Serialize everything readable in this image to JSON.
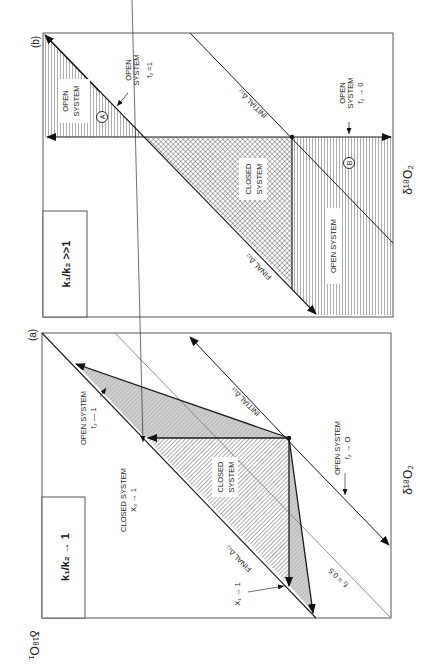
{
  "figure": {
    "orientation": "rotated-90-ccw",
    "colors": {
      "line": "#1a1a1a",
      "thin_line": "#6a6a6a",
      "shade": "#cfcfcf",
      "frame": "#555555"
    }
  },
  "panel_b": {
    "tag": "(b)",
    "ratio_label": "k₁/k₂ >>1",
    "x_axis_label": "δ¹⁸O₂",
    "regions": {
      "a_label": "OPEN SYSTEM",
      "a_marker": "A",
      "closed_label_1": "CLOSED",
      "closed_label_2": "SYSTEM",
      "b_label": "OPEN SYSTEM",
      "b_marker": "B"
    },
    "annotations": {
      "open_f2_1_line1": "OPEN",
      "open_f2_1_line2": "SYSTEM",
      "open_f2_1_line3": "f₂ =1",
      "open_f2_0_line1": "OPEN",
      "open_f2_0_line2": "SYSTEM",
      "open_f2_0_line3": "f₂ → 0"
    },
    "lines": {
      "initial": "INITIAL Δ₁₂",
      "final": "FINAL Δ₁₂"
    }
  },
  "panel_a": {
    "tag": "(a)",
    "ratio_label": "k₁/k₂ → 1",
    "x_axis_label": "δ¹⁸O₂",
    "y_axis_label": "δ¹⁸O₁",
    "regions": {
      "closed_label_1": "CLOSED",
      "closed_label_2": "SYSTEM"
    },
    "annotations": {
      "open_f2_1_line1": "OPEN SYSTEM",
      "open_f2_1_line2": "f₂ — 1",
      "closed_x2_line1": "CLOSED SYSTEM",
      "closed_x2_line2": "X₂ → 1",
      "x1": "X₁ → 1",
      "open_f2_0_line1": "OPEN SYSTEM",
      "open_f2_0_line2": "f₂ → O",
      "f2_half": "f₂ = 0.5"
    },
    "lines": {
      "initial": "INITIAL Δ₁₂",
      "final": "FINAL Δ₁₂"
    }
  }
}
